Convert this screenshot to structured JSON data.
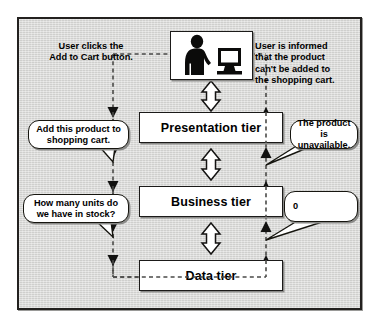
{
  "figure": {
    "background_color": "#d8d8d6",
    "border_color": "#23211f"
  },
  "user_image": {
    "icon": "user-at-computer-icon",
    "alt": "Silhouette of a user standing next to a desktop computer"
  },
  "tiers": [
    {
      "id": "presentation",
      "label": "Presentation tier"
    },
    {
      "id": "business",
      "label": "Business tier"
    },
    {
      "id": "data",
      "label": "Data tier"
    }
  ],
  "notes": {
    "left": "User clicks the\nAdd to Cart button.",
    "right": "User is informed\nthat the product\ncan't be added to\nthe shopping cart."
  },
  "bubbles": [
    {
      "id": "add-to-cart",
      "text": "Add this product to shopping cart."
    },
    {
      "id": "product-unavailable",
      "text": "The product is unavailable."
    },
    {
      "id": "units-in-stock",
      "text": "How many units do we have in stock?"
    },
    {
      "id": "stock-count",
      "text": "0"
    }
  ],
  "flow": {
    "request_path_label": "downward request flow",
    "response_path_label": "upward response flow",
    "connector_label": "bidirectional tier connector"
  }
}
